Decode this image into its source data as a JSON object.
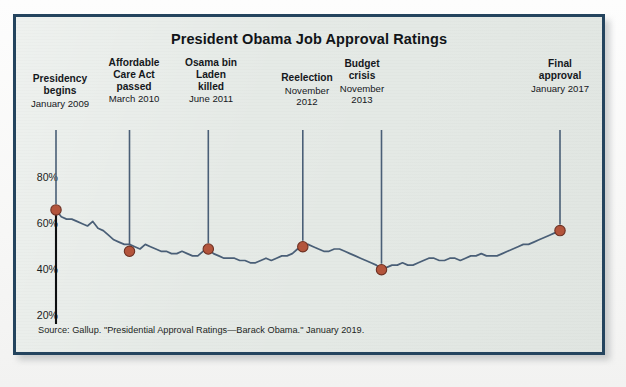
{
  "figure": {
    "title": "President Obama Job Approval Ratings",
    "source_note": "Source: Gallup. \"Presidential Approval Ratings—Barack Obama.\" January 2019.",
    "frame_color": "#24445e",
    "background_color": "#e4e9e5",
    "line_color": "#4a5f77",
    "marker_color": "#b4553c"
  },
  "annotations": [
    {
      "id": "presidency-begins",
      "heading": "Presidency\nbegins",
      "date": "January 2009"
    },
    {
      "id": "affordable-care-act",
      "heading": "Affordable\nCare Act\npassed",
      "date": "March 2010"
    },
    {
      "id": "osama-bin-laden",
      "heading": "Osama bin\nLaden\nkilled",
      "date": "June 2011"
    },
    {
      "id": "reelection",
      "heading": "Reelection",
      "date": "November\n2012"
    },
    {
      "id": "budget-crisis",
      "heading": "Budget\ncrisis",
      "date": "November\n2013"
    },
    {
      "id": "final-approval",
      "heading": "Final\napproval",
      "date": "January 2017"
    }
  ],
  "chart_data": {
    "type": "line",
    "title": "President Obama Job Approval Ratings",
    "xlabel": "",
    "ylabel": "",
    "ylim": [
      15,
      85
    ],
    "yticks": [
      "20%",
      "40%",
      "60%",
      "80%"
    ],
    "ytick_values": [
      20,
      40,
      60,
      80
    ],
    "grid": false,
    "legend": "none",
    "xrange": [
      "January 2009",
      "January 2017"
    ],
    "annotated_points": [
      {
        "label": "Presidency begins",
        "date": "January 2009",
        "value": 67
      },
      {
        "label": "Affordable Care Act passed",
        "date": "March 2010",
        "value": 49
      },
      {
        "label": "Osama bin Laden killed",
        "date": "June 2011",
        "value": 50
      },
      {
        "label": "Reelection",
        "date": "November 2012",
        "value": 51
      },
      {
        "label": "Budget crisis",
        "date": "November 2013",
        "value": 41
      },
      {
        "label": "Final approval",
        "date": "January 2017",
        "value": 58
      }
    ],
    "series": [
      {
        "name": "Job approval",
        "x": [
          0,
          1,
          2,
          3,
          4,
          5,
          6,
          7,
          8,
          9,
          10,
          11,
          12,
          13,
          14,
          15,
          16,
          17,
          18,
          19,
          20,
          21,
          22,
          23,
          24,
          25,
          26,
          27,
          28,
          29,
          30,
          31,
          32,
          33,
          34,
          35,
          36,
          37,
          38,
          39,
          40,
          41,
          42,
          43,
          44,
          45,
          46,
          47,
          48,
          49,
          50,
          51,
          52,
          53,
          54,
          55,
          56,
          57,
          58,
          59,
          60,
          61,
          62,
          63,
          64,
          65,
          66,
          67,
          68,
          69,
          70,
          71,
          72,
          73,
          74,
          75,
          76,
          77,
          78,
          79,
          80,
          81,
          82,
          83,
          84,
          85,
          86,
          87,
          88,
          89,
          90,
          91,
          92,
          93,
          94,
          95,
          96
        ],
        "values": [
          67,
          64,
          63,
          63,
          62,
          61,
          60,
          62,
          59,
          58,
          56,
          54,
          53,
          52,
          52,
          51,
          50,
          52,
          51,
          50,
          49,
          49,
          48,
          48,
          49,
          48,
          47,
          47,
          49,
          50,
          48,
          47,
          46,
          46,
          46,
          45,
          45,
          44,
          44,
          45,
          46,
          45,
          46,
          47,
          47,
          48,
          50,
          51,
          52,
          51,
          50,
          49,
          49,
          50,
          50,
          49,
          48,
          47,
          46,
          45,
          44,
          43,
          41,
          42,
          43,
          43,
          44,
          43,
          43,
          44,
          45,
          46,
          46,
          45,
          45,
          46,
          46,
          45,
          46,
          47,
          47,
          48,
          47,
          47,
          47,
          48,
          49,
          50,
          51,
          52,
          52,
          53,
          54,
          55,
          56,
          57,
          58
        ]
      }
    ]
  }
}
